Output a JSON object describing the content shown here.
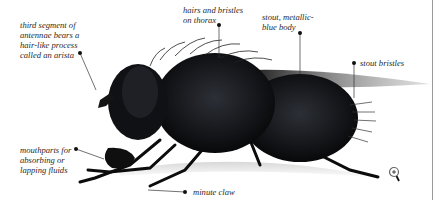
{
  "figure": {
    "labels": [
      {
        "id": "arista",
        "text": "third segment of\nantennae bears a\nhair-like process\ncalled an arista"
      },
      {
        "id": "thorax-hairs",
        "text": "hairs and bristles\non thorax"
      },
      {
        "id": "body",
        "text": "stout, metallic-\nblue body"
      },
      {
        "id": "bristles",
        "text": "stout bristles"
      },
      {
        "id": "mouthparts",
        "text": "mouthparts for\nabsorbing or\nlapping fluids"
      },
      {
        "id": "claw",
        "text": "minute claw"
      }
    ],
    "zoom_icon": "magnifier-plus-icon",
    "colors": {
      "ink": "#111111",
      "label_text": "#2a2a2a",
      "leader": "#333333",
      "rule": "#9a9a9a"
    }
  }
}
